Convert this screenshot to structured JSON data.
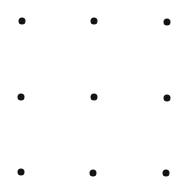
{
  "canvas": {
    "width": 184,
    "height": 189,
    "background": "#ffffff"
  },
  "dot_style": {
    "color": "#141414",
    "diameter": 7
  },
  "grid": {
    "rows": 3,
    "cols": 3
  },
  "dots": [
    {
      "row": 0,
      "col": 0,
      "x": 21.5,
      "y": 21
    },
    {
      "row": 0,
      "col": 1,
      "x": 93.5,
      "y": 21
    },
    {
      "row": 0,
      "col": 2,
      "x": 166.5,
      "y": 22
    },
    {
      "row": 1,
      "col": 0,
      "x": 21,
      "y": 96.5
    },
    {
      "row": 1,
      "col": 1,
      "x": 93.5,
      "y": 97
    },
    {
      "row": 1,
      "col": 2,
      "x": 166.5,
      "y": 97.5
    },
    {
      "row": 2,
      "col": 0,
      "x": 20.5,
      "y": 172
    },
    {
      "row": 2,
      "col": 1,
      "x": 93,
      "y": 172.5
    },
    {
      "row": 2,
      "col": 2,
      "x": 166,
      "y": 173
    }
  ]
}
